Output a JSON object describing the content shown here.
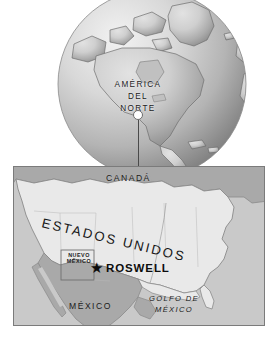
{
  "figure": {
    "kind": "locator-map",
    "background_color": "#ffffff"
  },
  "globe": {
    "name": "north-america-globe",
    "labels": {
      "line1": "AMÉRICA",
      "line2": "DEL",
      "line3": "NORTE"
    },
    "marker": {
      "name": "roswell-globe-point",
      "style": "white-circle"
    },
    "colors": {
      "ocean_light": "#d6d6d6",
      "ocean_dark": "#8e8e8e",
      "land": "#bdbdbd",
      "outline": "#6e6e6e"
    }
  },
  "map": {
    "name": "southwest-usa-detail-map",
    "labels": {
      "canada": "CANADÁ",
      "united_states": "ESTADOS UNIDOS",
      "new_mexico_line1": "NUEVO",
      "new_mexico_line2": "MÉXICO",
      "city": "ROSWELL",
      "mexico": "MÉXICO",
      "gulf_line1": "GOLFO DE",
      "gulf_line2": "MÉXICO"
    },
    "marker": {
      "name": "roswell-star",
      "glyph": "★",
      "color": "#0d0d0d"
    },
    "colors": {
      "water": "#c9c9c9",
      "usa_fill": "#e9e9e9",
      "neighbor_fill": "#a9a9a9",
      "border_line": "#8a8a8a",
      "panel_border": "#7b7b7b"
    }
  }
}
